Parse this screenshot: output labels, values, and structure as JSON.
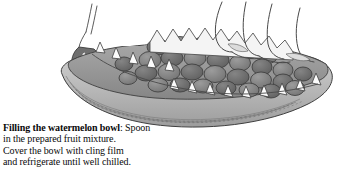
{
  "figure": {
    "kind": "grayscale-line-illustration",
    "elements": {
      "melon_bowl": "halved watermelon hollowed into a bowl with zigzag vandyke-cut rim",
      "fruit_filling": "rounded fruit chunks heaped inside the bowl",
      "zigzag_teeth": "white triangular points cut along the rim",
      "rind_stripes": "curved striping bands on the outer rind",
      "hand": "hand and fingers at upper right holding the bowl",
      "spoon": "spoon handle at upper left"
    },
    "palette": {
      "background": "#ffffff",
      "rind_light": "#cfcfcf",
      "rind_mid": "#b3b3b3",
      "rind_dark": "#8f8f8f",
      "flesh_shadow": "#9a9a9a",
      "fruit_chunk": "#8a8a8a",
      "fruit_chunk_dark": "#6e6e6e",
      "tooth_white": "#fbfbfb",
      "outline": "#3a3a3a",
      "text": "#0a0a0a"
    }
  },
  "caption": {
    "lead": "Filling the watermelon bowl",
    "line1_rest": ": Spoon",
    "line2": "in the prepared fruit mixture.",
    "line3": "Cover the bowl with cling film",
    "line4": "and refrigerate until well chilled."
  }
}
